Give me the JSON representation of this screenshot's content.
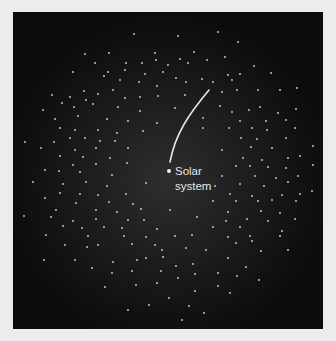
{
  "figure": {
    "label_line1": "Solar",
    "label_line2": "system",
    "colors": {
      "background": "#ececec",
      "space_center": "#2e2e2e",
      "space_edge": "#0b0b0b",
      "stars": "#d8d8d8",
      "trajectory": "#e8e8e8"
    }
  }
}
